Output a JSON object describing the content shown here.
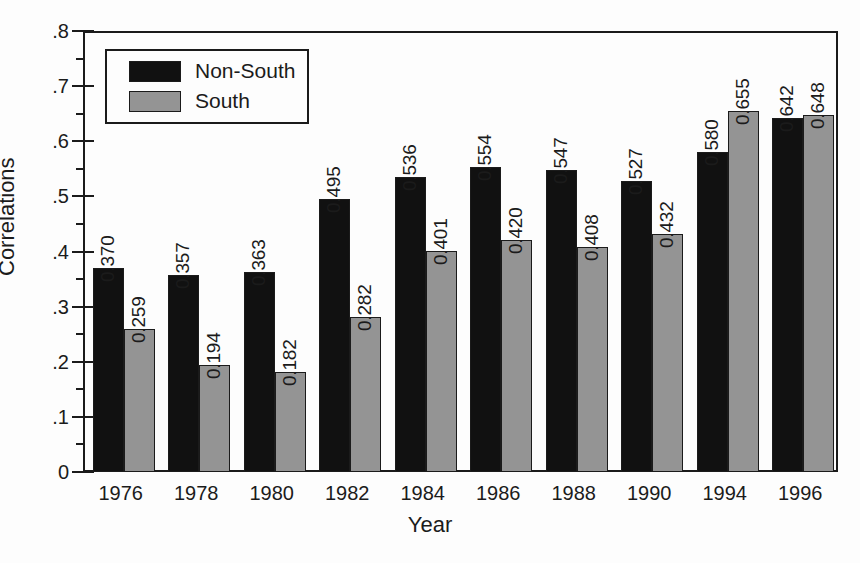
{
  "chart_data": {
    "type": "bar",
    "title": "",
    "xlabel": "Year",
    "ylabel": "Correlations",
    "ylim": [
      0,
      0.8
    ],
    "ytick_labels": [
      "0",
      ".1",
      ".2",
      ".3",
      ".4",
      ".5",
      ".6",
      ".7",
      ".8"
    ],
    "ytick_values": [
      0,
      0.1,
      0.2,
      0.3,
      0.4,
      0.5,
      0.6,
      0.7,
      0.8
    ],
    "minor_tick_step": 0.05,
    "grid": false,
    "legend_position": "top-left",
    "categories": [
      "1976",
      "1978",
      "1980",
      "1982",
      "1984",
      "1986",
      "1988",
      "1990",
      "1994",
      "1996"
    ],
    "series": [
      {
        "name": "Non-South",
        "color": "#111111",
        "values": [
          0.37,
          0.357,
          0.363,
          0.495,
          0.536,
          0.554,
          0.547,
          0.527,
          0.58,
          0.642
        ],
        "labels": [
          "0.370",
          "0.357",
          "0.363",
          "0.495",
          "0.536",
          "0.554",
          "0.547",
          "0.527",
          "0.580",
          "0.642"
        ]
      },
      {
        "name": "South",
        "color": "#949494",
        "values": [
          0.259,
          0.194,
          0.182,
          0.282,
          0.401,
          0.42,
          0.408,
          0.432,
          0.655,
          0.648
        ],
        "labels": [
          "0.259",
          "0.194",
          "0.182",
          "0.282",
          "0.401",
          "0.420",
          "0.408",
          "0.432",
          "0.655",
          "0.648"
        ]
      }
    ]
  },
  "legend": {
    "items": [
      {
        "label": "Non-South",
        "color": "#111111"
      },
      {
        "label": "South",
        "color": "#949494"
      }
    ]
  },
  "axes": {
    "y_title": "Correlations",
    "x_title": "Year"
  }
}
